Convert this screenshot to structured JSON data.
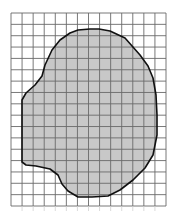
{
  "figure": {
    "type": "grid-area-estimation",
    "description": "Irregular shaded shape drawn on square grid paper",
    "grid": {
      "left": 11,
      "top": 13,
      "right": 166,
      "bottom": 206,
      "columns": 14,
      "rows": 17,
      "line_color": "#6a6a6a"
    },
    "shape": {
      "fill": "#c8c8c8",
      "stroke": "#111111",
      "points": [
        [
          70,
          33
        ],
        [
          78,
          30
        ],
        [
          90,
          29
        ],
        [
          99,
          29
        ],
        [
          110,
          31
        ],
        [
          125,
          38
        ],
        [
          140,
          55
        ],
        [
          148,
          66
        ],
        [
          153,
          78
        ],
        [
          156,
          95
        ],
        [
          157,
          115
        ],
        [
          157,
          135
        ],
        [
          153,
          155
        ],
        [
          145,
          168
        ],
        [
          133,
          180
        ],
        [
          120,
          190
        ],
        [
          108,
          196
        ],
        [
          92,
          197
        ],
        [
          78,
          197
        ],
        [
          68,
          191
        ],
        [
          62,
          184
        ],
        [
          58,
          175
        ],
        [
          50,
          169
        ],
        [
          36,
          166
        ],
        [
          26,
          165
        ],
        [
          22,
          162
        ],
        [
          22,
          100
        ],
        [
          26,
          93
        ],
        [
          35,
          85
        ],
        [
          42,
          76
        ],
        [
          45,
          65
        ],
        [
          52,
          50
        ],
        [
          60,
          40
        ]
      ]
    },
    "ticks_below": true
  }
}
